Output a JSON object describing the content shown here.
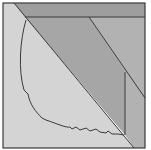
{
  "diagram": {
    "type": "geometric-dissection",
    "frame": {
      "x": 3,
      "y": 3,
      "width": 142,
      "height": 145
    },
    "colors": {
      "background": "#ffffff",
      "light_region": "#d4d4d4",
      "mid_region": "#a8a8a8",
      "dark_band": "#9a9a9a",
      "right_strip": "#b4b4b4",
      "stroke": "#3a3a3a"
    },
    "regions": [
      {
        "name": "light-left-triangle",
        "points": "3,3 14,3 134,148 3,148",
        "color": "#d4d4d4"
      },
      {
        "name": "top-band",
        "points": "14,3 145,3 145,17 25,17",
        "color": "#9e9e9e"
      },
      {
        "name": "center-wedge",
        "points": "25,17 89,17 125,70 125,135",
        "color": "#a6a6a6"
      },
      {
        "name": "right-strip",
        "points": "89,17 145,17 145,148 134,148 125,135 125,70",
        "color": "#b2b2b2"
      }
    ],
    "lines": [
      {
        "name": "main-diagonal",
        "x1": 14,
        "y1": 3,
        "x2": 134,
        "y2": 148
      },
      {
        "name": "band-line",
        "x1": 25,
        "y1": 17,
        "x2": 145,
        "y2": 17
      },
      {
        "name": "second-diagonal",
        "x1": 89,
        "y1": 17,
        "x2": 145,
        "y2": 98
      },
      {
        "name": "vertical-line",
        "x1": 125,
        "y1": 72,
        "x2": 125,
        "y2": 135
      }
    ],
    "curve": {
      "name": "freeform-curve",
      "d": "M26,20 C20,40 18,70 24,90 L28,94 C30,105 36,112 42,118 L46,120 C58,124 66,128 70,127 L72,129 L76,127 L80,130 L86,128 L90,131 L96,129 L100,132 L106,133 L108,131 L112,134 L118,134 L124,135"
    }
  }
}
